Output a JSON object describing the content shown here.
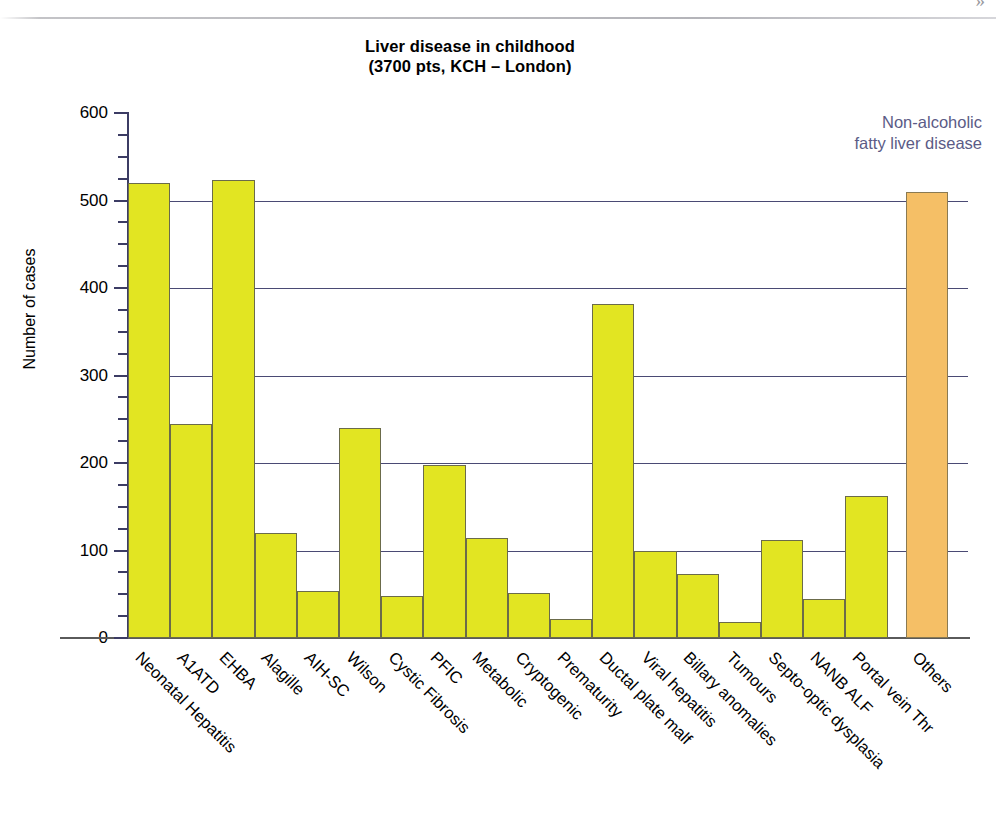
{
  "page": {
    "header_glyph": "»"
  },
  "annotation": {
    "line1": "Non-alcoholic",
    "line2": "fatty liver disease",
    "color": "#5b5b86"
  },
  "chart_data": {
    "type": "bar",
    "title": "Liver disease in childhood",
    "subtitle": "(3700 pts, KCH – London)",
    "xlabel": "",
    "ylabel": "Number of cases",
    "ylim": [
      0,
      600
    ],
    "ytick_labels": [
      "0",
      "100",
      "200",
      "300",
      "400",
      "500",
      "600"
    ],
    "ytick_values": [
      0,
      100,
      200,
      300,
      400,
      500,
      600
    ],
    "minor_tick_step": 25,
    "grid": "horizontal",
    "legend": "none",
    "bar_color": "#e2e522",
    "accent_bar_color": "#f5bf66",
    "gridline_color": "#4a4a74",
    "categories": [
      "Neonatal Hepatitis",
      "A1ATD",
      "EHBA",
      "Alagille",
      "AIH-SC",
      "Wilson",
      "Cystic Fibrosis",
      "PFIC",
      "Metabolic",
      "Cryptogenic",
      "Prematurity",
      "Ductal plate malf",
      "Viral hepatitis",
      "Billary anomalies",
      "Tumours",
      "Septo-optic dysplasia",
      "NANB ALF",
      "Portal vein Thr",
      "Others"
    ],
    "values": [
      520,
      245,
      524,
      120,
      54,
      240,
      48,
      198,
      114,
      52,
      22,
      382,
      100,
      73,
      18,
      112,
      45,
      162,
      510
    ],
    "highlighted_category": "Others",
    "annotations": [
      {
        "text": "Non-alcoholic fatty liver disease",
        "target_category": "Others"
      }
    ]
  }
}
